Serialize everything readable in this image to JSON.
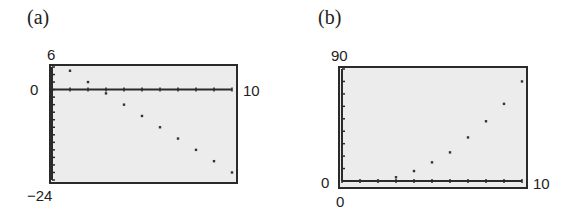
{
  "panels": [
    {
      "label": "(a)",
      "ymax_label": "6",
      "ymin_label": "−24",
      "xmin_label": "0",
      "xmax_label": "10",
      "left_y_label": "0"
    },
    {
      "label": "(b)",
      "ymax_label": "90",
      "ymin_label": "0",
      "xmin_label": "0",
      "xmax_label": "10",
      "left_y_label": "0"
    }
  ],
  "colors": {
    "frame": "#2a2a2a",
    "plot_bg": "#ececec",
    "point": "#333333",
    "axis": "#2a2a2a"
  },
  "chart_data": [
    {
      "type": "scatter",
      "title": "(a)",
      "xlabel": "",
      "ylabel": "",
      "xlim": [
        0,
        10
      ],
      "ylim": [
        -24,
        6
      ],
      "xtick_step": 1,
      "ytick_step": 2,
      "grid": false,
      "x": [
        1,
        2,
        3,
        4,
        5,
        6,
        7,
        8,
        9,
        10
      ],
      "y": [
        5,
        2,
        -1,
        -4,
        -7,
        -10,
        -13,
        -16,
        -19,
        -22
      ]
    },
    {
      "type": "scatter",
      "title": "(b)",
      "xlabel": "",
      "ylabel": "",
      "xlim": [
        0,
        10
      ],
      "ylim": [
        0,
        90
      ],
      "xtick_step": 1,
      "ytick_step": 10,
      "grid": false,
      "x": [
        1,
        2,
        3,
        4,
        5,
        6,
        7,
        8,
        9,
        10
      ],
      "y": [
        0,
        0,
        3,
        8,
        15,
        23,
        35,
        48,
        62,
        80
      ]
    }
  ]
}
